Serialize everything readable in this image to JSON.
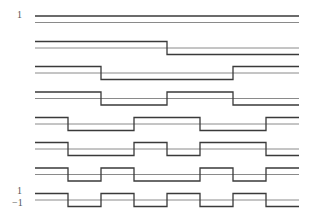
{
  "diagram": {
    "colors": {
      "waveform": "#3a3a3a",
      "baseline": "#8a8a8a",
      "background": "#ffffff"
    },
    "geometry": {
      "x_start": 35,
      "segment_width": 33,
      "segments": 8,
      "amplitude": 6.5
    },
    "labels": {
      "top_one": "1",
      "bottom_one": "1",
      "bottom_minus_one": "−1"
    },
    "rows": [
      {
        "name": "walsh-0",
        "baseline_y": 22.5,
        "signs": [
          1,
          1,
          1,
          1,
          1,
          1,
          1,
          1
        ]
      },
      {
        "name": "walsh-1",
        "baseline_y": 48,
        "signs": [
          1,
          1,
          1,
          1,
          -1,
          -1,
          -1,
          -1
        ]
      },
      {
        "name": "walsh-2",
        "baseline_y": 73,
        "signs": [
          1,
          1,
          -1,
          -1,
          -1,
          -1,
          1,
          1
        ]
      },
      {
        "name": "walsh-3",
        "baseline_y": 98.5,
        "signs": [
          1,
          1,
          -1,
          -1,
          1,
          1,
          -1,
          -1
        ]
      },
      {
        "name": "walsh-4",
        "baseline_y": 124,
        "signs": [
          1,
          -1,
          -1,
          1,
          1,
          -1,
          -1,
          1
        ]
      },
      {
        "name": "walsh-5",
        "baseline_y": 149,
        "signs": [
          1,
          -1,
          -1,
          1,
          -1,
          1,
          1,
          -1
        ]
      },
      {
        "name": "walsh-6",
        "baseline_y": 174.5,
        "signs": [
          1,
          -1,
          1,
          -1,
          -1,
          1,
          -1,
          1
        ]
      },
      {
        "name": "walsh-7",
        "baseline_y": 200,
        "signs": [
          1,
          -1,
          1,
          -1,
          1,
          -1,
          1,
          -1
        ]
      }
    ]
  }
}
